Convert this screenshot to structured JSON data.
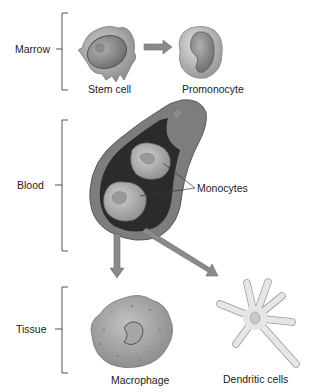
{
  "diagram": {
    "stages": [
      {
        "label": "Marrow"
      },
      {
        "label": "Blood"
      },
      {
        "label": "Tissue"
      }
    ],
    "cells": {
      "stem_cell": "Stem cell",
      "promonocyte": "Promonocyte",
      "monocytes": "Monocytes",
      "macrophage": "Macrophage",
      "dendritic_cells": "Dendritic cells"
    },
    "colors": {
      "arrow": "#8a8a8a",
      "vessel_wall": "#7d7d7d",
      "vessel_inner": "#2b2b2b",
      "cell_fill": "#b9b9b9",
      "dendritic_fill": "#e6e6e6"
    }
  }
}
